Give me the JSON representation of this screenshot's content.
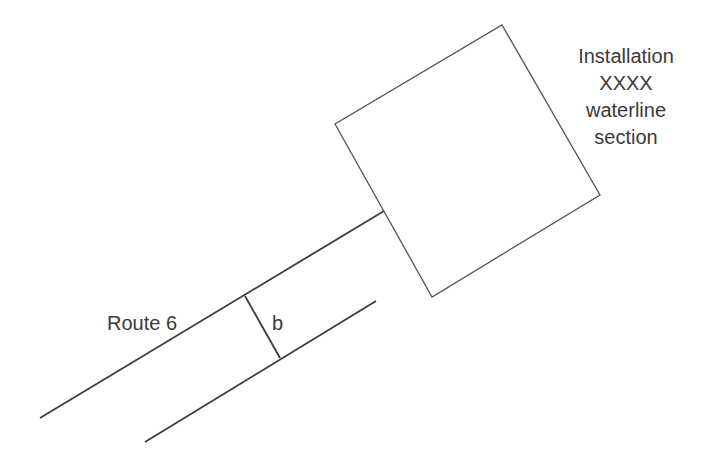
{
  "diagram": {
    "installation_label": {
      "lines": [
        "Installation",
        "XXXX",
        "waterline",
        "section"
      ],
      "center_x": 626,
      "baselines": [
        63,
        90,
        117,
        144
      ]
    },
    "route_label": {
      "text": "Route 6",
      "x": 107,
      "y": 330
    },
    "width_label": {
      "text": "b",
      "x": 272,
      "y": 330
    },
    "installation_box": {
      "points": [
        [
          502,
          25
        ],
        [
          600,
          195
        ],
        [
          432,
          297
        ],
        [
          335,
          124
        ]
      ]
    },
    "road_upper_edge": {
      "x1": 40,
      "y1": 418,
      "x2": 384,
      "y2": 211
    },
    "road_lower_edge": {
      "x1": 145,
      "y1": 442,
      "x2": 376,
      "y2": 301
    },
    "width_marker": {
      "x1": 245,
      "y1": 296,
      "x2": 280,
      "y2": 358
    },
    "colors": {
      "stroke": "#3c3c3c",
      "box_stroke": "#555555",
      "text": "#3a3a3a",
      "background": "#ffffff"
    }
  }
}
